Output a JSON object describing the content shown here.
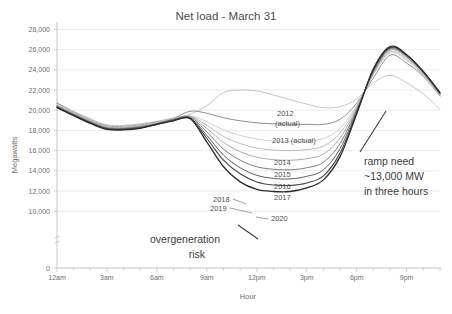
{
  "chart_data": {
    "type": "line",
    "title": "Net load - March 31",
    "xlabel": "Hour",
    "ylabel": "Megawatts",
    "grid": true,
    "legend_position": "inline-labels",
    "xlim": [
      0,
      23
    ],
    "ylim": [
      8600,
      28000
    ],
    "y_axis_break": true,
    "y_zero_label": "0",
    "yticks": [
      10000,
      12000,
      14000,
      16000,
      18000,
      20000,
      22000,
      24000,
      26000,
      28000
    ],
    "ytick_labels": [
      "10,000",
      "12,000",
      "14,000",
      "16,000",
      "18,000",
      "20,000",
      "22,000",
      "24,000",
      "26,000",
      "28,000"
    ],
    "xticks": [
      0,
      3,
      6,
      9,
      12,
      15,
      18,
      21
    ],
    "xtick_labels": [
      "12am",
      "3am",
      "6am",
      "9am",
      "12pm",
      "3pm",
      "6pm",
      "9pm"
    ],
    "x": [
      0,
      1,
      2,
      3,
      4,
      5,
      6,
      7,
      8,
      9,
      10,
      11,
      12,
      13,
      14,
      15,
      16,
      17,
      18,
      19,
      20,
      21,
      22,
      23
    ],
    "series": [
      {
        "name": "2012 (actual)",
        "label": "2012",
        "label2": "(actual)",
        "color": "#bdbdbd",
        "width": 0.9,
        "values": [
          20750,
          19900,
          19150,
          18550,
          18500,
          18650,
          18900,
          19250,
          19600,
          20450,
          21750,
          22000,
          21900,
          21500,
          21050,
          20600,
          20250,
          20350,
          21100,
          22700,
          23450,
          22700,
          21600,
          20100
        ]
      },
      {
        "name": "2013 (actual)",
        "label": "2013 (actual)",
        "color": "#8f8f8f",
        "width": 1.0,
        "values": [
          20700,
          19800,
          19050,
          18450,
          18400,
          18550,
          18850,
          19200,
          19900,
          19700,
          19250,
          18950,
          18750,
          18650,
          18600,
          18600,
          18600,
          19100,
          20700,
          23200,
          25450,
          24650,
          23350,
          21400
        ]
      },
      {
        "name": "2014",
        "label": "2014",
        "color": "#c9c9c9",
        "width": 0.9,
        "values": [
          20600,
          19750,
          19000,
          18400,
          18350,
          18500,
          18800,
          19200,
          19450,
          18850,
          18050,
          17500,
          17150,
          16950,
          16900,
          16950,
          17200,
          18200,
          20500,
          23500,
          25650,
          24900,
          23450,
          21450
        ]
      },
      {
        "name": "2015",
        "label": "2015",
        "color": "#b5b5b5",
        "width": 0.9,
        "values": [
          20500,
          19700,
          18950,
          18350,
          18300,
          18450,
          18750,
          19150,
          19400,
          18500,
          17400,
          16700,
          16250,
          16050,
          16000,
          16100,
          16450,
          17750,
          20350,
          23600,
          25800,
          25050,
          23550,
          21500
        ]
      },
      {
        "name": "2016",
        "label": "2016",
        "color": "#a0a0a0",
        "width": 0.9,
        "values": [
          20450,
          19650,
          18900,
          18300,
          18250,
          18400,
          18700,
          19100,
          19350,
          18200,
          16800,
          15900,
          15350,
          15100,
          15050,
          15200,
          15650,
          17250,
          20200,
          23700,
          25950,
          25200,
          23650,
          21550
        ]
      },
      {
        "name": "2017",
        "label": "2017",
        "color": "#7d7d7d",
        "width": 1.0,
        "values": [
          20400,
          19600,
          18850,
          18250,
          18200,
          18350,
          18650,
          19100,
          19300,
          17850,
          16150,
          15050,
          14400,
          14150,
          14100,
          14300,
          14850,
          16700,
          20050,
          23800,
          26050,
          25300,
          23700,
          21600
        ]
      },
      {
        "name": "2018",
        "label": "2018",
        "color": "#5c5c5c",
        "width": 1.0,
        "values": [
          20350,
          19550,
          18800,
          18200,
          18150,
          18300,
          18650,
          19050,
          19250,
          17500,
          15550,
          14300,
          13550,
          13250,
          13200,
          13450,
          14100,
          16200,
          19900,
          23900,
          26150,
          25400,
          23750,
          21650
        ]
      },
      {
        "name": "2019",
        "label": "2019",
        "color": "#454545",
        "width": 1.1,
        "values": [
          20300,
          19500,
          18750,
          18150,
          18100,
          18250,
          18600,
          19000,
          19200,
          17200,
          15050,
          13700,
          12900,
          12600,
          12550,
          12800,
          13500,
          15750,
          19750,
          24000,
          26200,
          25450,
          23800,
          21700
        ]
      },
      {
        "name": "2020",
        "label": "2020",
        "color": "#2b2b2b",
        "width": 1.3,
        "values": [
          20250,
          19450,
          18700,
          18100,
          18050,
          18200,
          18600,
          18950,
          19150,
          16850,
          14400,
          12900,
          12150,
          11950,
          11950,
          12300,
          13100,
          15400,
          19650,
          24100,
          26300,
          25500,
          23850,
          21750
        ]
      }
    ],
    "annotations": [
      {
        "id": "ramp-need",
        "lines": [
          "ramp need",
          "~13,000 MW",
          "in three hours"
        ],
        "value_mw": 13000,
        "duration": "three hours"
      },
      {
        "id": "overgeneration-risk",
        "lines": [
          "overgeneration",
          "risk"
        ]
      }
    ]
  }
}
